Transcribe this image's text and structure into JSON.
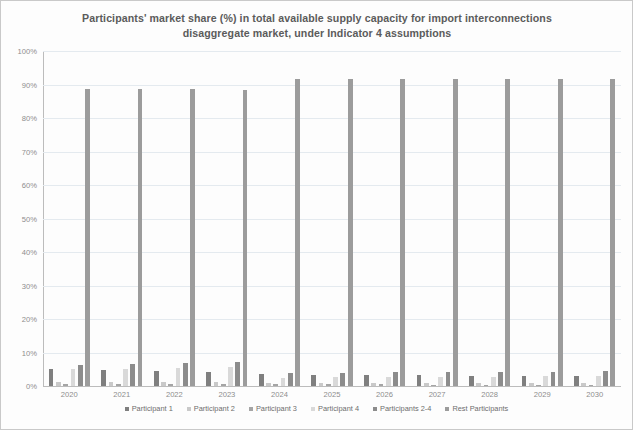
{
  "chart_data": {
    "type": "bar",
    "title": "Participants' market share (%) in total available supply capacity for import interconnections disaggregate market, under Indicator 4 assumptions",
    "title_line1": "Participants' market share (%) in total available supply capacity for import interconnections",
    "title_line2": "disaggregate market, under Indicator 4 assumptions",
    "xlabel": "",
    "ylabel": "",
    "ylim": [
      0,
      100
    ],
    "ytick_labels": [
      "0%",
      "10%",
      "20%",
      "30%",
      "40%",
      "50%",
      "60%",
      "70%",
      "80%",
      "90%",
      "100%"
    ],
    "ytick_values": [
      0,
      10,
      20,
      30,
      40,
      50,
      60,
      70,
      80,
      90,
      100
    ],
    "grid": true,
    "legend_position": "bottom",
    "categories": [
      "2020",
      "2021",
      "2022",
      "2023",
      "2024",
      "2025",
      "2026",
      "2027",
      "2028",
      "2029",
      "2030"
    ],
    "series": [
      {
        "name": "Participant 1",
        "color": "#7f7f7f",
        "values": [
          5.2,
          4.7,
          4.4,
          4.1,
          3.6,
          3.4,
          3.3,
          3.2,
          3.1,
          3.0,
          3.0
        ]
      },
      {
        "name": "Participant 2",
        "color": "#c9c9c9",
        "values": [
          1.3,
          1.2,
          1.2,
          1.1,
          1.0,
          1.0,
          0.9,
          0.9,
          0.9,
          0.9,
          0.9
        ]
      },
      {
        "name": "Participant 3",
        "color": "#a5a5a5",
        "values": [
          0.6,
          0.6,
          0.6,
          0.5,
          0.5,
          0.5,
          0.5,
          0.4,
          0.4,
          0.4,
          0.4
        ]
      },
      {
        "name": "Participant 4",
        "color": "#d9d9d9",
        "values": [
          5.0,
          5.2,
          5.5,
          5.6,
          2.5,
          2.6,
          2.7,
          2.8,
          2.8,
          2.9,
          2.9
        ]
      },
      {
        "name": "Participants 2-4",
        "color": "#8c8c8c",
        "values": [
          6.3,
          6.6,
          7.0,
          7.2,
          3.8,
          4.0,
          4.1,
          4.2,
          4.3,
          4.3,
          4.4
        ]
      },
      {
        "name": "Rest Participants",
        "color": "#9c9c9c",
        "values": [
          88.8,
          88.7,
          88.6,
          88.5,
          91.6,
          91.6,
          91.7,
          91.7,
          91.7,
          91.7,
          91.7
        ]
      }
    ]
  }
}
